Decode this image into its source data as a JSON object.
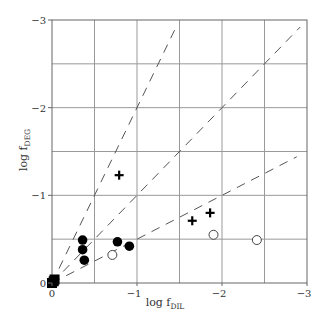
{
  "chart_data": {
    "type": "scatter",
    "title": "",
    "xlabel": "log f_DIL",
    "ylabel": "log f_DEG",
    "xlabel_main": "log f",
    "xlabel_sub": "DIL",
    "ylabel_main": "log f",
    "ylabel_sub": "DEG",
    "xlim": [
      0,
      -3
    ],
    "ylim": [
      0,
      -3
    ],
    "x_ticks": [
      "0",
      "−1",
      "−2",
      "−3"
    ],
    "y_ticks": [
      "0",
      "−1",
      "−2",
      "−3"
    ],
    "grid": true,
    "grid_step": 0.5,
    "reference_lines": [
      {
        "name": "slope 2",
        "slope": 2,
        "style": "dashed"
      },
      {
        "name": "slope 1",
        "slope": 1,
        "style": "dashed"
      },
      {
        "name": "slope 0.5",
        "slope": 0.5,
        "style": "dashed"
      }
    ],
    "series": [
      {
        "name": "filled squares",
        "marker": "square-filled",
        "points": [
          [
            0,
            0
          ],
          [
            -0.02,
            -0.02
          ],
          [
            -0.03,
            -0.04
          ]
        ]
      },
      {
        "name": "filled circles",
        "marker": "circle-filled",
        "points": [
          [
            -0.36,
            -0.49
          ],
          [
            -0.36,
            -0.38
          ],
          [
            -0.38,
            -0.26
          ],
          [
            -0.77,
            -0.47
          ],
          [
            -0.91,
            -0.42
          ]
        ]
      },
      {
        "name": "open circles",
        "marker": "circle-open",
        "points": [
          [
            -0.71,
            -0.32
          ],
          [
            -1.9,
            -0.55
          ],
          [
            -2.41,
            -0.49
          ]
        ]
      },
      {
        "name": "plus",
        "marker": "plus",
        "points": [
          [
            -0.79,
            -1.23
          ],
          [
            -1.65,
            -0.71
          ],
          [
            -1.86,
            -0.8
          ]
        ]
      }
    ]
  }
}
